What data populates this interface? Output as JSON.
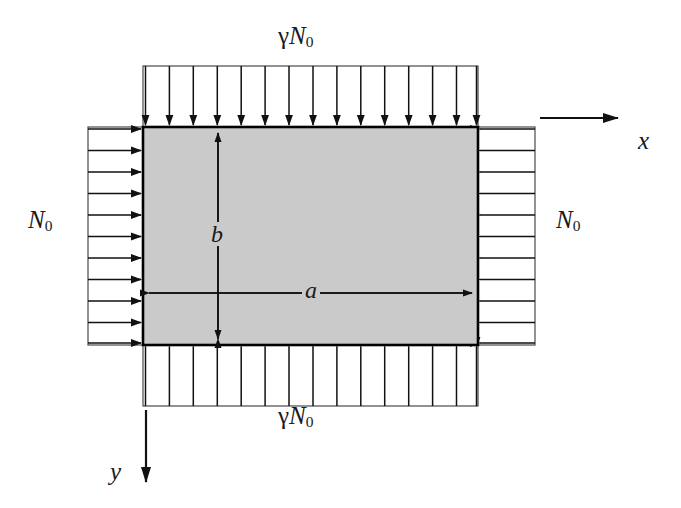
{
  "figure": {
    "type": "engineering-diagram",
    "canvas": {
      "width": 681,
      "height": 508,
      "background": "#ffffff"
    }
  },
  "plate": {
    "name": "rectangular-plate",
    "fill_color": "#cacaca",
    "edge_color": "#000000",
    "x": 143,
    "y": 127,
    "width": 335,
    "height": 218
  },
  "dimensions": {
    "width_label": "a",
    "width_label_desc": "plate length along x",
    "height_label": "b",
    "height_label_desc": "plate width along y"
  },
  "axes": {
    "x": {
      "label": "x",
      "direction": "right"
    },
    "y": {
      "label": "y",
      "direction": "down"
    }
  },
  "loads": [
    {
      "id": "load-top",
      "label_gamma": "γ",
      "label_base": "N",
      "label_sub": "0",
      "edge": "top",
      "arrow_direction": "down",
      "arrow_count": 15,
      "label_x": 310,
      "label_y": 28
    },
    {
      "id": "load-bottom",
      "label_gamma": "γ",
      "label_base": "N",
      "label_sub": "0",
      "edge": "bottom",
      "arrow_direction": "up",
      "arrow_count": 15,
      "label_x": 310,
      "label_y": 406
    },
    {
      "id": "load-left",
      "label_gamma": "",
      "label_base": "N",
      "label_sub": "0",
      "edge": "left",
      "arrow_direction": "right",
      "arrow_count": 11,
      "label_x": 30,
      "label_y": 208
    },
    {
      "id": "load-right",
      "label_gamma": "",
      "label_base": "N",
      "label_sub": "0",
      "edge": "right",
      "arrow_direction": "left",
      "arrow_count": 11,
      "label_x": 520,
      "label_y": 208
    }
  ],
  "load_boxes": {
    "top": {
      "x": 143,
      "y": 66,
      "width": 335,
      "height": 61
    },
    "bottom": {
      "x": 143,
      "y": 345,
      "width": 335,
      "height": 61
    },
    "left": {
      "x": 88,
      "y": 127,
      "width": 55,
      "height": 218
    },
    "right": {
      "x": 478,
      "y": 127,
      "width": 57,
      "height": 218
    }
  }
}
